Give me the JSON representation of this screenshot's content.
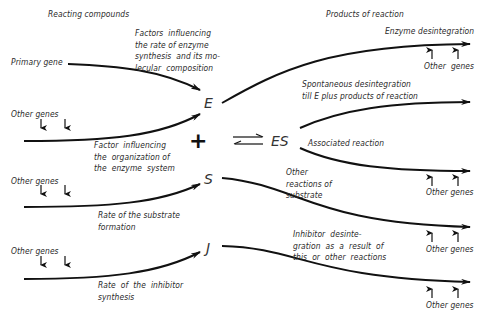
{
  "headers": {
    "left": "Reacting compounds",
    "right": "Products of reaction"
  },
  "inputs": {
    "primary_gene": "Primary gene",
    "other_genes_1": "Other genes",
    "other_genes_2": "Other genes",
    "other_genes_3": "Other genes"
  },
  "factors": {
    "enzyme_synthesis": "Factors  influencing\nthe rate of enzyme\nsynthesis  and its mo-\nlecular  composition",
    "organization": "Factor  influencing\nthe  organization of\nthe  enzyme  system",
    "substrate_rate": "Rate of the substrate\nformation",
    "inhibitor_rate": "Rate  of  the  inhibitor\nsynthesis"
  },
  "symbols": {
    "enzyme": "E",
    "plus": "+",
    "complex": "ES",
    "substrate": "S",
    "inhibitor": "J"
  },
  "products": {
    "enzyme_disintegration": "Enzyme desintegration",
    "spontaneous": "Spontaneous desintegration\ntill E plus products of reaction",
    "associated": "Associated reaction",
    "other_reactions": "Other\nreactions of\nsubstrate",
    "inhibitor_disintegration": "Inhibitor  desinte-\ngration  as  a  result  of\nthis  or  other  reactions"
  },
  "outputs": {
    "other_genes_r1": "Other  genes",
    "other_genes_r2": "Other genes",
    "other_genes_r3": "Other genes",
    "other_genes_r4": "Other genes"
  },
  "colors": {
    "line": "#111111",
    "text": "#2a2a2a",
    "background": "#ffffff"
  }
}
